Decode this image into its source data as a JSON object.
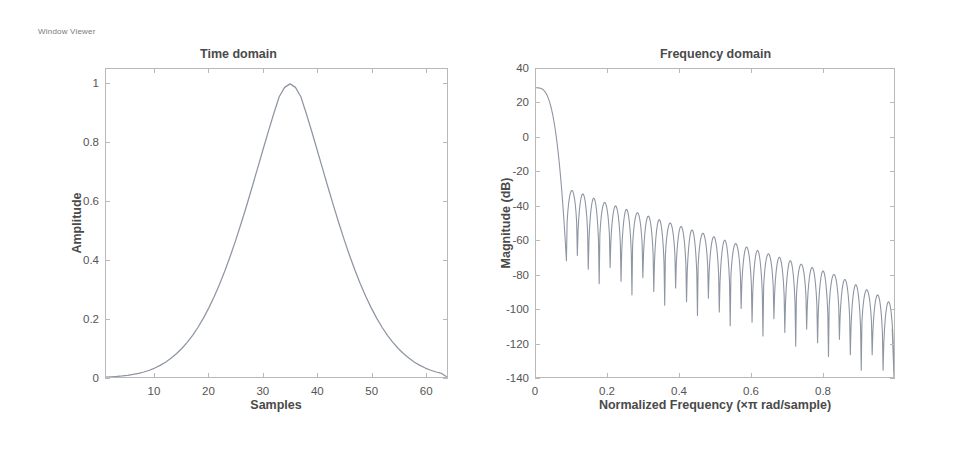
{
  "window": {
    "title": "Window Viewer"
  },
  "colors": {
    "curve": "#8e95a3",
    "axis": "#b9b9b9",
    "text": "#4a4a4a",
    "background": "#ffffff"
  },
  "chart_data": [
    {
      "type": "line",
      "name": "time-domain",
      "title": "Time domain",
      "xlabel": "Samples",
      "ylabel": "Amplitude",
      "xlim": [
        1,
        64
      ],
      "ylim": [
        0,
        1.05
      ],
      "xticks": [
        10,
        20,
        30,
        40,
        50,
        60
      ],
      "xticklabels": [
        "10",
        "20",
        "30",
        "40",
        "50",
        "60"
      ],
      "yticks": [
        0,
        0.2,
        0.4,
        0.6,
        0.8,
        1
      ],
      "yticklabels": [
        "0",
        "0.2",
        "0.4",
        "0.6",
        "0.8",
        "1"
      ],
      "grid": false,
      "legend": false,
      "peak_sample": 33,
      "peak_value": 1,
      "x": [
        1,
        2,
        3,
        4,
        5,
        6,
        7,
        8,
        9,
        10,
        11,
        12,
        13,
        14,
        15,
        16,
        17,
        18,
        19,
        20,
        21,
        22,
        23,
        24,
        25,
        26,
        27,
        28,
        29,
        30,
        31,
        32,
        33,
        34,
        35,
        36,
        37,
        38,
        39,
        40,
        41,
        42,
        43,
        44,
        45,
        46,
        47,
        48,
        49,
        50,
        51,
        52,
        53,
        54,
        55,
        56,
        57,
        58,
        59,
        60,
        61,
        62,
        63,
        64
      ],
      "values": [
        0.0,
        0.0008,
        0.0019,
        0.0035,
        0.0057,
        0.0086,
        0.0123,
        0.0171,
        0.0231,
        0.0305,
        0.0396,
        0.0505,
        0.0636,
        0.0791,
        0.0971,
        0.1181,
        0.1422,
        0.1697,
        0.2008,
        0.2357,
        0.2745,
        0.3172,
        0.3639,
        0.4144,
        0.4684,
        0.5257,
        0.5857,
        0.6478,
        0.7112,
        0.7748,
        0.8376,
        0.8983,
        0.9553,
        0.9874,
        0.9993,
        0.9874,
        0.9553,
        0.8983,
        0.8376,
        0.7748,
        0.7112,
        0.6478,
        0.5857,
        0.5257,
        0.4684,
        0.4144,
        0.3639,
        0.3172,
        0.2745,
        0.2357,
        0.2008,
        0.1697,
        0.1422,
        0.1181,
        0.0971,
        0.0791,
        0.0636,
        0.0505,
        0.0396,
        0.0305,
        0.0231,
        0.0171,
        0.0123,
        0.0
      ]
    },
    {
      "type": "line",
      "name": "frequency-domain",
      "title": "Frequency domain",
      "xlabel": "Normalized Frequency  (×π rad/sample)",
      "ylabel": "Magnitude (dB)",
      "xlim": [
        0,
        1
      ],
      "ylim": [
        -140,
        40
      ],
      "xticks": [
        0,
        0.2,
        0.4,
        0.6,
        0.8
      ],
      "xticklabels": [
        "0",
        "0.2",
        "0.4",
        "0.6",
        "0.8"
      ],
      "yticks": [
        40,
        20,
        0,
        -20,
        -40,
        -60,
        -80,
        -100,
        -120,
        -140
      ],
      "yticklabels": [
        "40",
        "20",
        "0",
        "-20",
        "-40",
        "-60",
        "-80",
        "-100",
        "-120",
        "-140"
      ],
      "grid": false,
      "legend": false,
      "dc_magnitude_db": 29,
      "first_sidelobe_db": -31,
      "final_magnitude_db": -112,
      "mainlobe_null_freq": 0.085,
      "sidelobe_count": 30,
      "sidelobe_peaks_db": [
        -31,
        -33,
        -35.5,
        -38,
        -40,
        -42,
        -44,
        -46,
        -48,
        -50,
        -52,
        -54,
        -56,
        -58,
        -60,
        -62,
        -64,
        -66,
        -68,
        -70,
        -72,
        -74,
        -76,
        -78,
        -80,
        -83,
        -86,
        -89,
        -92,
        -96
      ]
    }
  ]
}
